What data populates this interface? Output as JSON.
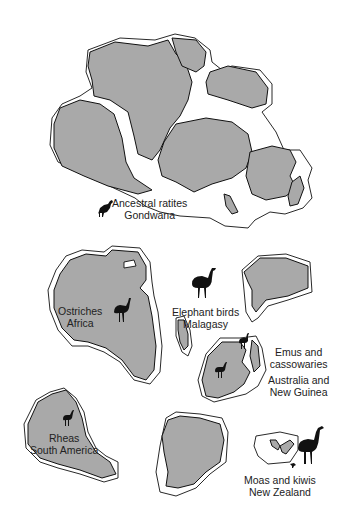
{
  "diagram": {
    "type": "biogeography-map",
    "colors": {
      "land": "#a9a9a9",
      "outline": "#111111",
      "background": "#ffffff"
    },
    "top_map": {
      "caption": {
        "line1": "Ancestral ratites",
        "line2": "Gondwana"
      }
    },
    "bottom_map": {
      "regions": [
        {
          "id": "africa",
          "bird_group": "Ostriches",
          "place": "Africa"
        },
        {
          "id": "madagascar",
          "bird_group": "Elephant birds",
          "place": "Malagasy"
        },
        {
          "id": "australia",
          "bird_group": "Emus and",
          "bird_group_2": "cassowaries",
          "place": "Australia and",
          "place_2": "New Guinea"
        },
        {
          "id": "south-america",
          "bird_group": "Rheas",
          "place": "South America"
        },
        {
          "id": "new-zealand",
          "bird_group": "Moas and kiwis",
          "place": "New Zealand"
        }
      ]
    }
  }
}
